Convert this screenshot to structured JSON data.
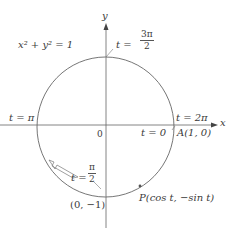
{
  "diagram": {
    "equation": "x² + y² = 1",
    "axes": {
      "x_label": "x",
      "y_label": "y",
      "origin_label": "0"
    },
    "points": {
      "A": "A(1, 0)",
      "bottom": "(0, −1)",
      "P": "P(cos t, −sin t)"
    },
    "parameter_labels": {
      "t0": "t = 0",
      "t2pi": "t = 2π",
      "tpi": "t = π",
      "t3pi2_prefix": "t =",
      "t3pi2_num": "3π",
      "t3pi2_den": "2",
      "tpi2_prefix": "t =",
      "tpi2_num": "π",
      "tpi2_den": "2"
    },
    "colors": {
      "stroke": "#555555",
      "text": "#3a3a3a"
    }
  }
}
